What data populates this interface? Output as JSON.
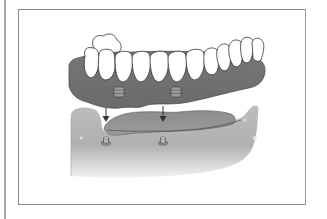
{
  "figure": {
    "elements": [
      "denture-teeth",
      "denture-base",
      "attachment-housing",
      "insertion-arrow",
      "jaw-ridge",
      "implant-abutment"
    ],
    "attachment_count": 2,
    "implant_count": 2,
    "colors": {
      "gum_base": "#6f6f6f",
      "teeth": "#ffffff",
      "jaw_light": "#c8c8c8",
      "jaw_dark": "#8c8c8c",
      "outline": "#333333",
      "frame": "#8a8a8a"
    }
  }
}
